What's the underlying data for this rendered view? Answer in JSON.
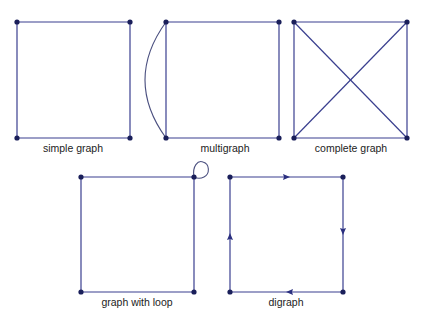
{
  "colors": {
    "edge": "#3a3f8f",
    "node": "#1a1f5a",
    "label": "#222222",
    "background": "#ffffff"
  },
  "graphs": [
    {
      "id": "simple",
      "label": "simple graph",
      "nodes": 4,
      "edges": 4,
      "features": []
    },
    {
      "id": "multi",
      "label": "multigraph",
      "nodes": 4,
      "edges": 5,
      "features": [
        "parallel edge between left vertices"
      ]
    },
    {
      "id": "complete",
      "label": "complete graph",
      "nodes": 4,
      "edges": 6,
      "features": [
        "two diagonals"
      ]
    },
    {
      "id": "loop",
      "label": "graph with loop",
      "nodes": 4,
      "edges": 5,
      "features": [
        "self-loop at top-right vertex"
      ]
    },
    {
      "id": "digraph",
      "label": "digraph",
      "nodes": 4,
      "edges": 4,
      "features": [
        "clockwise directed edges"
      ]
    }
  ]
}
